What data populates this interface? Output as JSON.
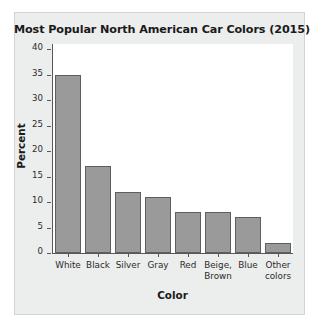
{
  "chart_data": {
    "type": "bar",
    "title": "Most Popular North American Car Colors (2015)",
    "xlabel": "Color",
    "ylabel": "Percent",
    "categories": [
      "White",
      "Black",
      "Silver",
      "Gray",
      "Red",
      "Beige, Brown",
      "Blue",
      "Other colors"
    ],
    "category_lines": [
      [
        "White"
      ],
      [
        "Black"
      ],
      [
        "Silver"
      ],
      [
        "Gray"
      ],
      [
        "Red"
      ],
      [
        "Beige,",
        "Brown"
      ],
      [
        "Blue"
      ],
      [
        "Other",
        "colors"
      ]
    ],
    "values": [
      35,
      17,
      12,
      11,
      8,
      8,
      7,
      2
    ],
    "ylim": [
      0,
      41
    ],
    "yticks": [
      0,
      5,
      10,
      15,
      20,
      25,
      30,
      35,
      40
    ],
    "ytick_labels": [
      "0",
      "5",
      "10",
      "15",
      "20",
      "25",
      "30",
      "35",
      "40"
    ],
    "grid": false,
    "legend": "none",
    "bar_color": "#9a9a9a",
    "bar_edge_color": "#5e5e5e",
    "panel_color": "#eceded",
    "plot_color": "#ffffff",
    "axis_color": "#56585a"
  }
}
